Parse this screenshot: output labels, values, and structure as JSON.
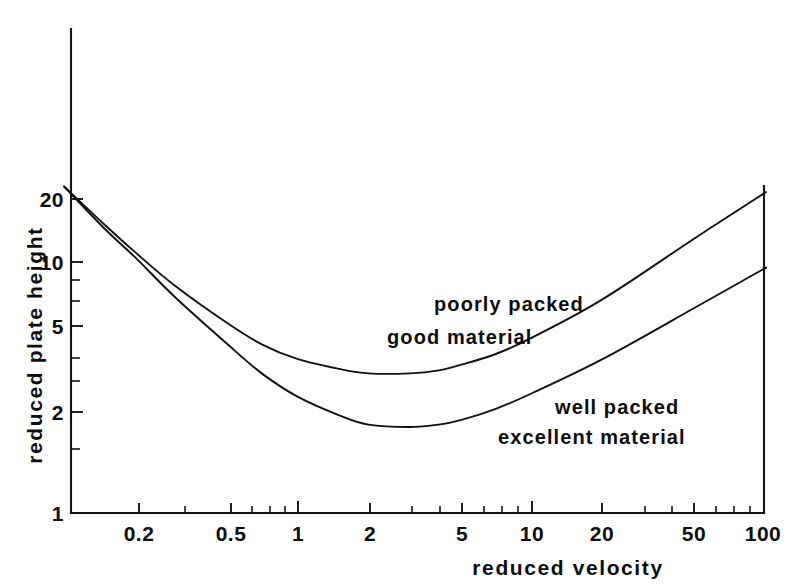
{
  "chart_data": {
    "type": "line",
    "title": "",
    "xlabel": "reduced velocity",
    "ylabel": "reduced plate height",
    "xscale": "log",
    "yscale": "log",
    "xlim": [
      0.1,
      100
    ],
    "ylim": [
      1,
      30
    ],
    "grid": false,
    "legend": "annotations-on-curves",
    "xticks": [
      "0.2",
      "0.5",
      "1",
      "2",
      "5",
      "10",
      "20",
      "50",
      "100"
    ],
    "xtick_values": [
      0.2,
      0.5,
      1,
      2,
      5,
      10,
      20,
      50,
      100
    ],
    "yticks": [
      "1",
      "2",
      "5",
      "10",
      "20"
    ],
    "ytick_values": [
      1,
      2,
      5,
      10,
      20
    ],
    "series": [
      {
        "name": "poorly packed good material",
        "annotation_lines": [
          "poorly  packed",
          "good  material"
        ],
        "x": [
          0.1,
          0.15,
          0.2,
          0.3,
          0.5,
          0.7,
          1.0,
          1.5,
          2.0,
          3.0,
          4.0,
          5.0,
          7.0,
          10.0,
          20.0,
          50.0,
          100.0
        ],
        "values": [
          20.0,
          14.0,
          11.0,
          8.0,
          5.7,
          4.7,
          4.1,
          3.75,
          3.6,
          3.6,
          3.7,
          3.9,
          4.3,
          5.0,
          7.1,
          12.5,
          19.0
        ]
      },
      {
        "name": "well packed excellent material",
        "annotation_lines": [
          "well  packed",
          "excellent  material"
        ],
        "x": [
          0.1,
          0.15,
          0.2,
          0.3,
          0.5,
          0.7,
          1.0,
          1.5,
          2.0,
          3.0,
          4.0,
          5.0,
          7.0,
          10.0,
          20.0,
          50.0,
          100.0
        ],
        "values": [
          20.0,
          13.5,
          10.5,
          7.2,
          4.7,
          3.6,
          2.9,
          2.45,
          2.25,
          2.2,
          2.25,
          2.35,
          2.6,
          3.0,
          4.1,
          6.6,
          9.5
        ]
      }
    ],
    "annotations": [
      {
        "id": "poorly-packed",
        "line1": "poorly  packed",
        "line2": "good  material",
        "x_data": 1.55,
        "y_data": 6.0
      },
      {
        "id": "well-packed",
        "line1": "well  packed",
        "line2": "excellent  material",
        "x_data": 7.0,
        "y_data": 2.65
      }
    ]
  },
  "axes": {
    "x_title": "reduced velocity",
    "y_title": "reduced plate height"
  }
}
